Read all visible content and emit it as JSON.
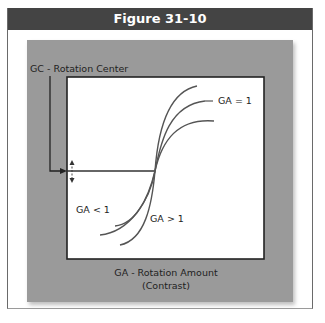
{
  "figure": {
    "title": "Figure 31-10",
    "rotation_center_label": "GC - Rotation Center",
    "axis_label_line1": "GA - Rotation Amount",
    "axis_label_line2": "(Contrast)",
    "curve_labels": {
      "ga_eq_1": "GA = 1",
      "ga_lt_1": "GA < 1",
      "ga_gt_1": "GA > 1"
    },
    "icons": {
      "arrow": "arrow-right-icon",
      "updown": "double-headed-vertical-arrow-icon"
    },
    "colors": {
      "title_bar": "#444444",
      "panel": "#9a9a9a",
      "curve": "#555555",
      "line": "#333333"
    }
  }
}
